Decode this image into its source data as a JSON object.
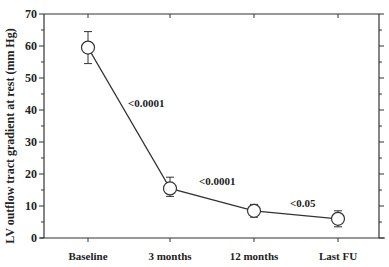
{
  "chart_data": {
    "type": "line",
    "title": "",
    "xlabel": "",
    "ylabel": "LV outflow tract gradient at rest (mm Hg)",
    "categories": [
      "Baseline",
      "3 months",
      "12 months",
      "Last FU"
    ],
    "series": [
      {
        "name": "LV outflow tract gradient",
        "values": [
          59.5,
          15.5,
          8.5,
          6
        ],
        "error_low": [
          54.5,
          13,
          6.5,
          3.5
        ],
        "error_high": [
          64.5,
          19,
          10.5,
          8.5
        ],
        "marker": "open-circle"
      }
    ],
    "ylim": [
      0,
      70
    ],
    "yticks": [
      0,
      10,
      20,
      30,
      40,
      50,
      60,
      70
    ],
    "grid": false,
    "legend": null,
    "annotations": [
      {
        "text": "<0.0001",
        "between": [
          "Baseline",
          "3 months"
        ]
      },
      {
        "text": "<0.0001",
        "between": [
          "3 months",
          "12 months"
        ]
      },
      {
        "text": "<0.05",
        "between": [
          "12 months",
          "Last FU"
        ]
      }
    ]
  },
  "colors": {
    "line": "#333333",
    "axis": "#333333",
    "marker_fill": "#ffffff",
    "text": "#222222"
  }
}
